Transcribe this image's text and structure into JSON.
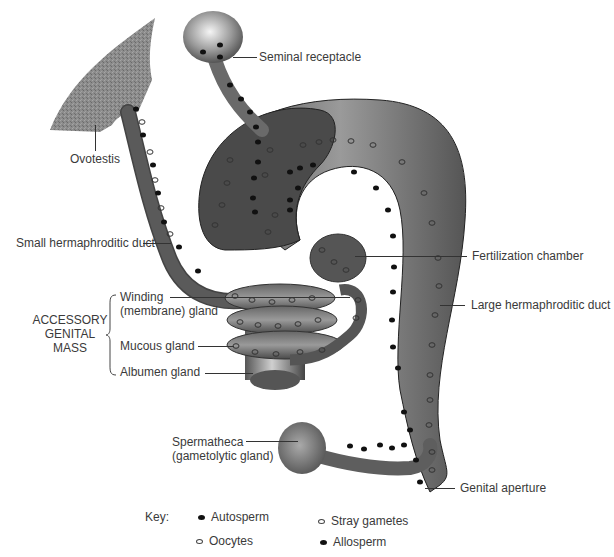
{
  "labels": {
    "seminal_receptacle": "Seminal receptacle",
    "ovotestis": "Ovotestis",
    "small_duct": "Small hermaphroditic duct",
    "fertilization_chamber": "Fertilization chamber",
    "large_duct": "Large hermaphroditic duct",
    "accessory_mass": [
      "ACCESSORY",
      "GENITAL",
      "MASS"
    ],
    "winding_gland": [
      "Winding",
      "(membrane) gland"
    ],
    "mucous_gland": "Mucous gland",
    "albumen_gland": "Albumen gland",
    "spermatheca": [
      "Spermatheca",
      "(gametolytic gland)"
    ],
    "genital_aperture": "Genital aperture"
  },
  "key": {
    "title": "Key:",
    "items": [
      {
        "symbol": "filled-ellipse",
        "label": "Autosperm"
      },
      {
        "symbol": "open-ellipse",
        "label": "Stray gametes"
      },
      {
        "symbol": "open-ellipse",
        "label": "Oocytes"
      },
      {
        "symbol": "filled-ellipse",
        "label": "Allosperm"
      }
    ]
  },
  "colors": {
    "tissue_dark": "#4a4a4a",
    "tissue_mid": "#7a7a7a",
    "tissue_light": "#bdbdbd",
    "ovotestis": "#8c8c8c",
    "outline": "#222222",
    "text": "#3a3a3a"
  }
}
